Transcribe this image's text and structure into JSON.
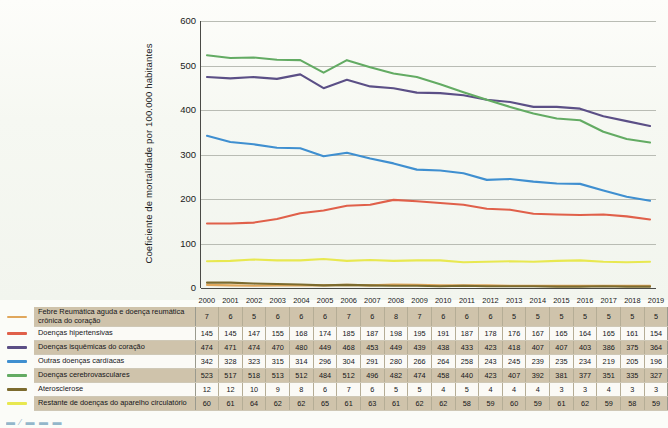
{
  "chart_data": {
    "type": "line",
    "title": "",
    "xlabel": "",
    "ylabel": "Coeficiente de mortalidade por 100.000 habitantes",
    "ylim": [
      0,
      600
    ],
    "yticks": [
      0,
      100,
      200,
      300,
      400,
      500,
      600
    ],
    "grid": true,
    "legend_position": "bottom-table",
    "categories": [
      "2000",
      "2001",
      "2002",
      "2003",
      "2004",
      "2005",
      "2006",
      "2007",
      "2008",
      "2009",
      "2010",
      "2011",
      "2012",
      "2013",
      "2014",
      "2015",
      "2016",
      "2017",
      "2018",
      "2019"
    ],
    "series": [
      {
        "name": "Febre Reumática aguda e doença reumática crônica do coração",
        "color": "#e0a75c",
        "values": [
          7,
          6,
          5,
          6,
          6,
          6,
          7,
          6,
          8,
          7,
          6,
          6,
          6,
          5,
          5,
          5,
          5,
          5,
          5,
          5
        ]
      },
      {
        "name": "Doenças hipertensivas",
        "color": "#e0604a",
        "values": [
          145,
          145,
          147,
          155,
          168,
          174,
          185,
          187,
          198,
          195,
          191,
          187,
          178,
          176,
          167,
          165,
          164,
          165,
          161,
          154
        ]
      },
      {
        "name": "Doenças isquêmicas do coração",
        "color": "#5b4f86",
        "values": [
          474,
          471,
          474,
          470,
          480,
          449,
          468,
          453,
          449,
          439,
          438,
          433,
          423,
          418,
          407,
          407,
          403,
          386,
          375,
          364
        ]
      },
      {
        "name": "Outras doenças cardíacas",
        "color": "#3f8fd0",
        "values": [
          342,
          328,
          323,
          315,
          314,
          296,
          304,
          291,
          280,
          266,
          264,
          258,
          243,
          245,
          239,
          235,
          234,
          219,
          205,
          196
        ]
      },
      {
        "name": "Doenças cerebrovasculares",
        "color": "#63ab63",
        "values": [
          523,
          517,
          518,
          513,
          512,
          484,
          512,
          496,
          482,
          474,
          458,
          440,
          423,
          407,
          392,
          381,
          377,
          351,
          335,
          327
        ]
      },
      {
        "name": "Aterosclerose",
        "color": "#7c6b2e",
        "values": [
          12,
          12,
          10,
          9,
          8,
          6,
          7,
          6,
          5,
          5,
          4,
          5,
          4,
          4,
          4,
          3,
          3,
          4,
          3,
          3
        ]
      },
      {
        "name": "Restante de doenças do aparelho circulatório",
        "color": "#e8e850",
        "values": [
          60,
          61,
          64,
          62,
          62,
          65,
          61,
          63,
          61,
          62,
          62,
          58,
          59,
          60,
          59,
          61,
          62,
          59,
          58,
          59
        ]
      }
    ]
  },
  "table": {
    "header_label": "",
    "years": [
      "2000",
      "2001",
      "2002",
      "2003",
      "2004",
      "2005",
      "2006",
      "2007",
      "2008",
      "2009",
      "2010",
      "2011",
      "2012",
      "2013",
      "2014",
      "2015",
      "2016",
      "2017",
      "2018",
      "2019"
    ],
    "rows": [
      {
        "label": "Febre Reumática aguda e doença reumática crônica do coração",
        "swatch_color": "#e0a75c",
        "values": [
          "7",
          "6",
          "5",
          "6",
          "6",
          "6",
          "7",
          "6",
          "8",
          "7",
          "6",
          "6",
          "6",
          "5",
          "5",
          "5",
          "5",
          "5",
          "5",
          "5"
        ]
      },
      {
        "label": "Doenças hipertensivas",
        "swatch_color": "#e0604a",
        "values": [
          "145",
          "145",
          "147",
          "155",
          "168",
          "174",
          "185",
          "187",
          "198",
          "195",
          "191",
          "187",
          "178",
          "176",
          "167",
          "165",
          "164",
          "165",
          "161",
          "154"
        ]
      },
      {
        "label": "Doenças isquêmicas do coração",
        "swatch_color": "#5b4f86",
        "values": [
          "474",
          "471",
          "474",
          "470",
          "480",
          "449",
          "468",
          "453",
          "449",
          "439",
          "438",
          "433",
          "423",
          "418",
          "407",
          "407",
          "403",
          "386",
          "375",
          "364"
        ]
      },
      {
        "label": "Outras doenças cardíacas",
        "swatch_color": "#3f8fd0",
        "values": [
          "342",
          "328",
          "323",
          "315",
          "314",
          "296",
          "304",
          "291",
          "280",
          "266",
          "264",
          "258",
          "243",
          "245",
          "239",
          "235",
          "234",
          "219",
          "205",
          "196"
        ]
      },
      {
        "label": "Doenças cerebrovasculares",
        "swatch_color": "#63ab63",
        "values": [
          "523",
          "517",
          "518",
          "513",
          "512",
          "484",
          "512",
          "496",
          "482",
          "474",
          "458",
          "440",
          "423",
          "407",
          "392",
          "381",
          "377",
          "351",
          "335",
          "327"
        ]
      },
      {
        "label": "Aterosclerose",
        "swatch_color": "#7c6b2e",
        "values": [
          "12",
          "12",
          "10",
          "9",
          "8",
          "6",
          "7",
          "6",
          "5",
          "5",
          "4",
          "5",
          "4",
          "4",
          "4",
          "3",
          "3",
          "4",
          "3",
          "3"
        ]
      },
      {
        "label": "Restante de doenças do aparelho circulatório",
        "swatch_color": "#e8e850",
        "values": [
          "60",
          "61",
          "64",
          "62",
          "62",
          "65",
          "61",
          "63",
          "61",
          "62",
          "62",
          "58",
          "59",
          "60",
          "59",
          "61",
          "62",
          "59",
          "58",
          "59"
        ]
      }
    ]
  },
  "caption": {
    "marks": "▬ ⁄ ▬   ▬ ▬",
    "text": ""
  }
}
